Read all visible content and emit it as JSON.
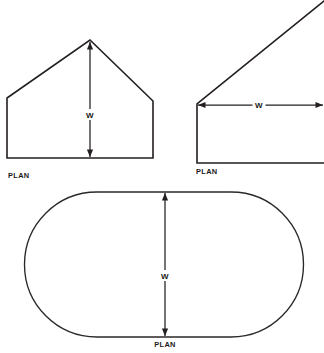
{
  "canvas": {
    "width": 324,
    "height": 353,
    "background": "#ffffff",
    "line_color": "#231f20"
  },
  "figures": [
    {
      "id": "gable-plan",
      "shape_name": "gable-pentagon",
      "plan_label": "PLAN",
      "dimension_label": "W",
      "dimension_orientation": "vertical",
      "geometry": {
        "left_wall_x": 7,
        "right_wall_x": 153,
        "base_y": 158,
        "eave_left_y": 98,
        "eave_right_y": 101,
        "apex_x": 90,
        "apex_y": 40
      },
      "dimension": {
        "x": 90,
        "y_top": 42,
        "y_bottom": 157,
        "label_x": 90,
        "label_y": 118
      },
      "plan_label_pos": {
        "x": 8,
        "y": 178
      }
    },
    {
      "id": "wedge-plan",
      "shape_name": "wedge-truncated",
      "plan_label": "PLAN",
      "dimension_label": "W",
      "dimension_orientation": "horizontal",
      "geometry": {
        "left_wall_x": 197,
        "corner_top_y": 104,
        "base_y": 163,
        "diagonal_end_x": 324,
        "diagonal_end_y": 1,
        "base_end_x": 324
      },
      "dimension": {
        "y": 105,
        "x_left": 198,
        "x_right": 323,
        "label_x": 259,
        "label_y": 108
      },
      "plan_label_pos": {
        "x": 196,
        "y": 174
      }
    },
    {
      "id": "stadium-plan",
      "shape_name": "stadium-rounded-rectangle",
      "plan_label": "PLAN",
      "dimension_label": "W",
      "dimension_orientation": "vertical",
      "geometry": {
        "left_x": 25,
        "right_x": 303,
        "top_y": 192,
        "bottom_y": 337,
        "corner_radius": 72
      },
      "dimension": {
        "x": 165,
        "y_top": 193,
        "y_bottom": 336,
        "label_x": 165,
        "label_y": 279
      },
      "plan_label_pos": {
        "x": 165,
        "y": 347
      }
    }
  ]
}
